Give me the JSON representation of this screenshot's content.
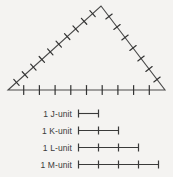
{
  "figure": {
    "type": "geometry-diagram",
    "background_color": "#f4f3f1",
    "line_color": "#4a4a4a",
    "triangle": {
      "vertices": {
        "left": [
          8,
          90
        ],
        "apex": [
          101,
          6
        ],
        "right": [
          165,
          90
        ]
      },
      "sides": [
        {
          "name": "left-side",
          "from": "left",
          "to": "apex",
          "tick_count": 10
        },
        {
          "name": "right-side",
          "from": "apex",
          "to": "right",
          "tick_count": 7
        },
        {
          "name": "base",
          "from": "left",
          "to": "right",
          "tick_count": 9
        }
      ]
    }
  },
  "legend": {
    "rows": [
      {
        "count": "1",
        "label": "J-unit",
        "segments": 1,
        "segment_px": 20
      },
      {
        "count": "1",
        "label": "K-unit",
        "segments": 2,
        "segment_px": 20
      },
      {
        "count": "1",
        "label": "L-unit",
        "segments": 3,
        "segment_px": 20
      },
      {
        "count": "1",
        "label": "M-unit",
        "segments": 4,
        "segment_px": 20
      }
    ]
  }
}
